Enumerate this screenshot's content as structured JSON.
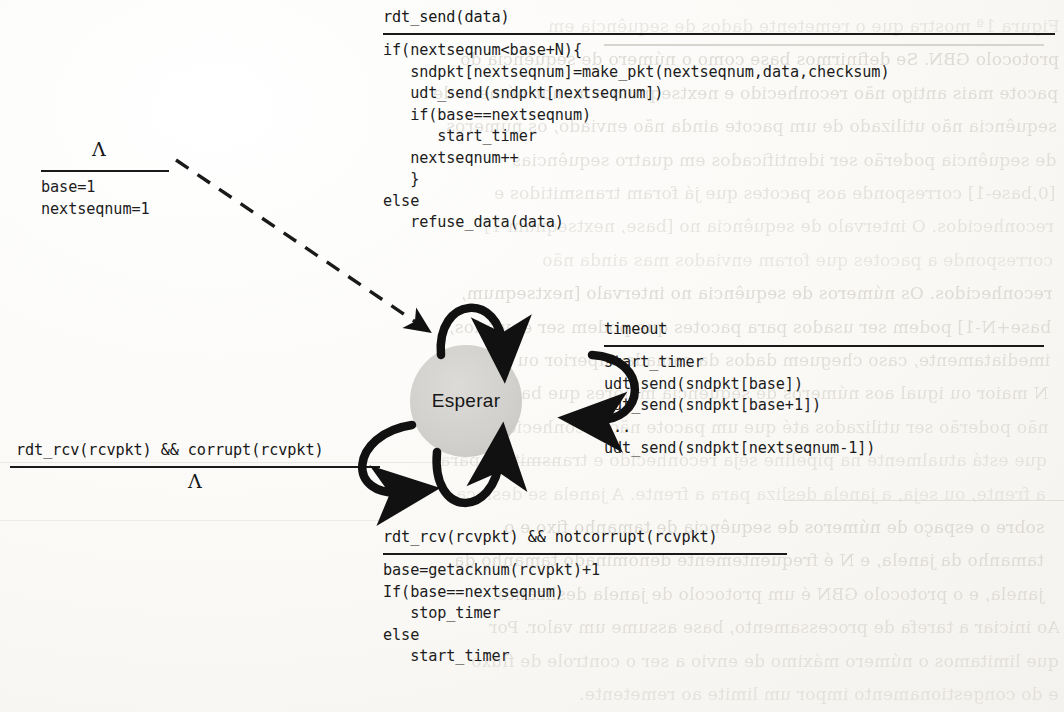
{
  "figure": {
    "state_label": "Esperar",
    "init_transition": {
      "event": "Λ",
      "actions": [
        "base=1",
        "nextseqnum=1"
      ]
    },
    "transitions": [
      {
        "id": "rdt-send",
        "event": "rdt_send(data)",
        "actions": [
          "if(nextseqnum<base+N){",
          "   sndpkt[nextseqnum]=make_pkt(nextseqnum,data,checksum)",
          "   udt_send(sndpkt[nextseqnum])",
          "   if(base==nextseqnum)",
          "      start_timer",
          "   nextseqnum++",
          "   }",
          "else",
          "   refuse_data(data)"
        ]
      },
      {
        "id": "timeout",
        "event": "timeout",
        "actions": [
          "start_timer",
          "udt_send(sndpkt[base])",
          "udt_send(sndpkt[base+1])",
          "...",
          "udt_send(sndpkt[nextseqnum-1])"
        ]
      },
      {
        "id": "rdt-rcv-corrupt",
        "event": "rdt_rcv(rcvpkt) && corrupt(rcvpkt)",
        "actions": [
          "Λ"
        ]
      },
      {
        "id": "rdt-rcv-notcorrupt",
        "event": "rdt_rcv(rcvpkt) && notcorrupt(rcvpkt)",
        "actions": [
          "base=getacknum(rcvpkt)+1",
          "If(base==nextseqnum)",
          "   stop_timer",
          "else",
          "   start_timer"
        ]
      }
    ]
  },
  "background_ghost_text": {
    "note": "faint mirrored bleed-through from the reverse side of the scanned page",
    "lines": [
      "Figura 1ª mostra que o remetente dados de sequência em",
      "protocolo GBN. Se definirmos base como o número de sequência do",
      "pacote mais antigo não reconhecido e nextseqnum o menor número de",
      "sequência não utilizado de um pacote ainda não enviado, os números",
      "de sequência poderão ser identificados em quatro sequências",
      "[0,base-1] corresponde aos pacotes que já foram transmitidos e",
      "reconhecidos. O intervalo de sequência no [base, nextseqnum-1]",
      "corresponde a pacotes que foram enviados mas ainda não",
      "reconhecidos. Os números de sequência no intervalo [nextseqnum,",
      "base+N-1] podem ser usados para pacotes que podem ser enviados,",
      "imediatamente, caso cheguem dados da camada superior ou tamanho",
      "N maior ou igual aos números de sequência maiores que base+N-1",
      "não poderão ser utilizados até que um pacote não reconhecido",
      "que está atualmente na pipeline seja reconhecido e transmitido para",
      "a frente, ou seja, a janela desliza para a frente. A janela se desloca",
      "sobre o espaço de números de sequência de tamanho fixo e o",
      "tamanho da janela, e N é frequentemente denominado tamanho da",
      "janela, e o protocolo GBN é um protocolo de janela deslizante.",
      "Ao iniciar a tarefa de processamento, base assume um valor. Por",
      "que limitamos o número máximo de envio a ser o controle de fluxo",
      "e do congestionamento impor um limite ao remetente."
    ]
  }
}
